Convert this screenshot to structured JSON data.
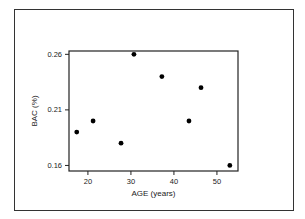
{
  "chart_data": {
    "type": "scatter",
    "title": "",
    "xlabel": "AGE (years)",
    "ylabel": "BAC (%)",
    "xlim": [
      15.6,
      54.9
    ],
    "ylim": [
      0.155,
      0.263
    ],
    "xticks": [
      20,
      30,
      40,
      50
    ],
    "xtick_labels": [
      "20",
      "30",
      "40",
      "50"
    ],
    "yticks": [
      0.16,
      0.21,
      0.26
    ],
    "ytick_labels": [
      "0.16",
      "0.21",
      "0.26"
    ],
    "grid": false,
    "legend": null,
    "marker_color": "#000000",
    "points": [
      {
        "x": 17.4,
        "y": 0.19
      },
      {
        "x": 21.2,
        "y": 0.2
      },
      {
        "x": 27.7,
        "y": 0.18
      },
      {
        "x": 30.7,
        "y": 0.26
      },
      {
        "x": 37.2,
        "y": 0.24
      },
      {
        "x": 43.5,
        "y": 0.2
      },
      {
        "x": 46.3,
        "y": 0.23
      },
      {
        "x": 53.0,
        "y": 0.16
      }
    ]
  }
}
